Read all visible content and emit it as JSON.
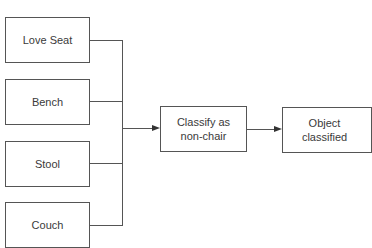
{
  "diagram": {
    "top_cutoff_text": "Yes/No",
    "inputs": [
      {
        "label": "Love Seat"
      },
      {
        "label": "Bench"
      },
      {
        "label": "Stool"
      },
      {
        "label": "Couch"
      }
    ],
    "process": {
      "label": "Classify as non-chair"
    },
    "output": {
      "label": "Object classified"
    },
    "colors": {
      "stroke": "#555555",
      "text": "#3a3a3a",
      "background": "#ffffff"
    }
  }
}
